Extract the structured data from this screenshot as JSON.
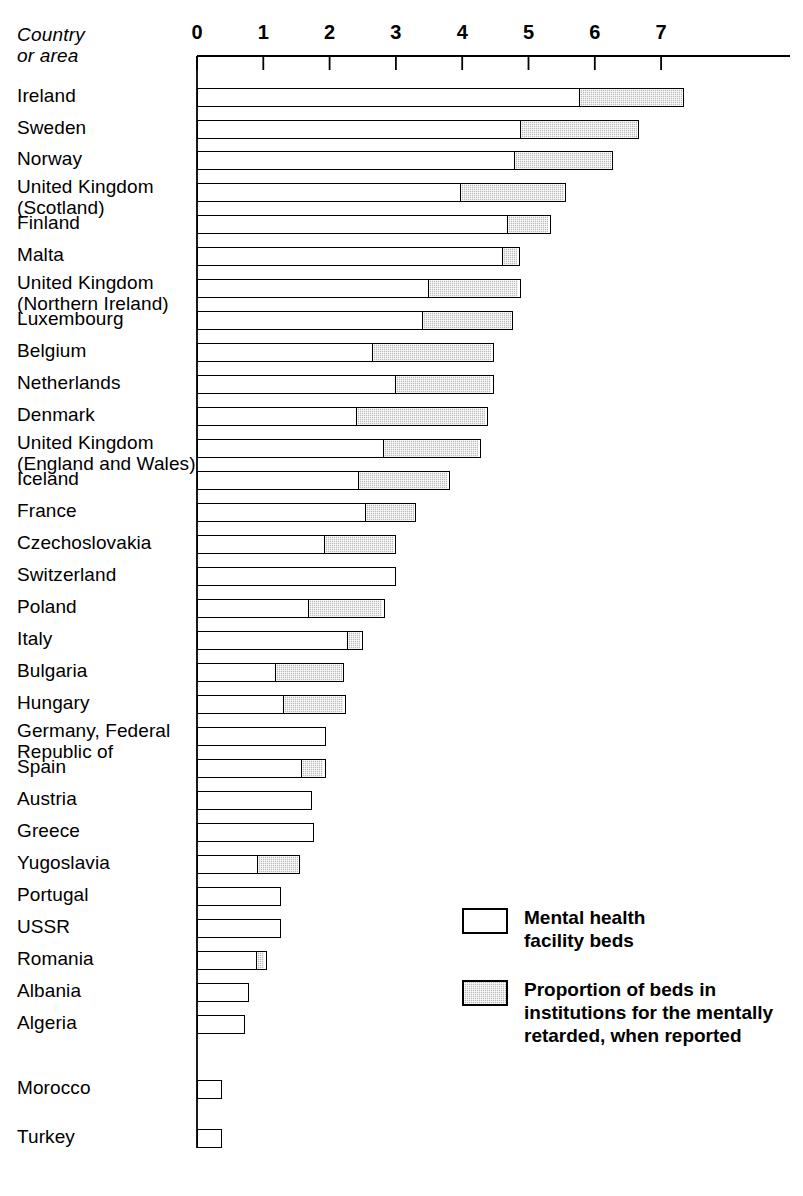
{
  "header": {
    "y_axis_title": "Country\nor area"
  },
  "legend": {
    "items": [
      {
        "swatch": "white",
        "label": "Mental health\nfacility beds"
      },
      {
        "swatch": "hatch",
        "label": "Proportion of beds in\ninstitutions for the mentally\nretarded, when reported"
      }
    ]
  },
  "chart_data": {
    "type": "bar",
    "orientation": "horizontal",
    "stacked": true,
    "title": "",
    "xlabel": "",
    "ylabel": "Country or area",
    "xlim": [
      0,
      7.6
    ],
    "grid": false,
    "legend_position": "inside-lower-right",
    "tick_labels": [
      "0",
      "1",
      "2",
      "3",
      "4",
      "5",
      "6",
      "7"
    ],
    "ticks": [
      0,
      1,
      2,
      3,
      4,
      5,
      6,
      7
    ],
    "series": [
      {
        "name": "Mental health facility beds",
        "fill": "white"
      },
      {
        "name": "Proportion of beds in institutions for the mentally retarded, when reported",
        "fill": "hatch"
      }
    ],
    "categories": [
      "Ireland",
      "Sweden",
      "Norway",
      "United Kingdom\n(Scotland)",
      "Finland",
      "Malta",
      "United Kingdom\n(Northern Ireland)",
      "Luxembourg",
      "Belgium",
      "Netherlands",
      "Denmark",
      "United Kingdom\n(England and Wales)",
      "Iceland",
      "France",
      "Czechoslovakia",
      "Switzerland",
      "Poland",
      "Italy",
      "Bulgaria",
      "Hungary",
      "Germany, Federal\n Republic of",
      "Spain",
      "Austria",
      "Greece",
      "Yugoslavia",
      "Portugal",
      "USSR",
      "Romania",
      "Albania",
      "Algeria",
      "Morocco",
      "Turkey"
    ],
    "rows": [
      {
        "label": "Ireland",
        "mental": 5.8,
        "retarded": 1.55,
        "total": 7.35,
        "label_lines": 1,
        "label_top": 85,
        "bar_top": 88
      },
      {
        "label": "Sweden",
        "mental": 4.91,
        "retarded": 1.76,
        "total": 6.67,
        "label_lines": 1,
        "label_top": 117,
        "bar_top": 120
      },
      {
        "label": "Norway",
        "mental": 4.82,
        "retarded": 1.46,
        "total": 6.28,
        "label_lines": 1,
        "label_top": 148,
        "bar_top": 151
      },
      {
        "label": "United Kingdom\n(Scotland)",
        "mental": 4.0,
        "retarded": 1.57,
        "total": 5.57,
        "label_lines": 2,
        "label_top": 176,
        "bar_top": 183
      },
      {
        "label": "Finland",
        "mental": 4.71,
        "retarded": 0.63,
        "total": 5.34,
        "label_lines": 1,
        "label_top": 212,
        "bar_top": 215
      },
      {
        "label": "Malta",
        "mental": 4.64,
        "retarded": 0.23,
        "total": 4.87,
        "label_lines": 1,
        "label_top": 244,
        "bar_top": 247
      },
      {
        "label": "United Kingdom\n(Northern Ireland)",
        "mental": 3.51,
        "retarded": 1.37,
        "total": 4.88,
        "label_lines": 2,
        "label_top": 272,
        "bar_top": 279
      },
      {
        "label": "Luxembourg",
        "mental": 3.42,
        "retarded": 1.35,
        "total": 4.77,
        "label_lines": 1,
        "label_top": 308,
        "bar_top": 311
      },
      {
        "label": "Belgium",
        "mental": 2.67,
        "retarded": 1.81,
        "total": 4.48,
        "label_lines": 1,
        "label_top": 340,
        "bar_top": 343
      },
      {
        "label": "Netherlands",
        "mental": 3.01,
        "retarded": 1.47,
        "total": 4.48,
        "label_lines": 1,
        "label_top": 372,
        "bar_top": 375
      },
      {
        "label": "Denmark",
        "mental": 2.43,
        "retarded": 1.96,
        "total": 4.39,
        "label_lines": 1,
        "label_top": 404,
        "bar_top": 407
      },
      {
        "label": "United Kingdom\n(England and Wales)",
        "mental": 2.83,
        "retarded": 1.45,
        "total": 4.28,
        "label_lines": 2,
        "label_top": 432,
        "bar_top": 439
      },
      {
        "label": "Iceland",
        "mental": 2.45,
        "retarded": 1.36,
        "total": 3.81,
        "label_lines": 1,
        "label_top": 468,
        "bar_top": 471
      },
      {
        "label": "France",
        "mental": 2.56,
        "retarded": 0.75,
        "total": 3.31,
        "label_lines": 1,
        "label_top": 500,
        "bar_top": 503
      },
      {
        "label": "Czechoslovakia",
        "mental": 1.95,
        "retarded": 1.05,
        "total": 3.0,
        "label_lines": 1,
        "label_top": 532,
        "bar_top": 535
      },
      {
        "label": "Switzerland",
        "mental": 3.0,
        "retarded": 0.0,
        "total": 3.0,
        "label_lines": 1,
        "label_top": 564,
        "bar_top": 567
      },
      {
        "label": "Poland",
        "mental": 1.7,
        "retarded": 1.13,
        "total": 2.83,
        "label_lines": 1,
        "label_top": 596,
        "bar_top": 599
      },
      {
        "label": "Italy",
        "mental": 2.3,
        "retarded": 0.2,
        "total": 2.5,
        "label_lines": 1,
        "label_top": 628,
        "bar_top": 631
      },
      {
        "label": "Bulgaria",
        "mental": 1.2,
        "retarded": 1.02,
        "total": 2.22,
        "label_lines": 1,
        "label_top": 660,
        "bar_top": 663
      },
      {
        "label": "Hungary",
        "mental": 1.32,
        "retarded": 0.92,
        "total": 2.24,
        "label_lines": 1,
        "label_top": 692,
        "bar_top": 695
      },
      {
        "label": "Germany, Federal\n Republic of",
        "mental": 1.94,
        "retarded": 0.0,
        "total": 1.94,
        "label_lines": 2,
        "label_top": 720,
        "bar_top": 727
      },
      {
        "label": "Spain",
        "mental": 1.61,
        "retarded": 0.33,
        "total": 1.94,
        "label_lines": 1,
        "label_top": 756,
        "bar_top": 759
      },
      {
        "label": "Austria",
        "mental": 1.74,
        "retarded": 0.0,
        "total": 1.74,
        "label_lines": 1,
        "label_top": 788,
        "bar_top": 791
      },
      {
        "label": "Greece",
        "mental": 1.76,
        "retarded": 0.0,
        "total": 1.76,
        "label_lines": 1,
        "label_top": 820,
        "bar_top": 823
      },
      {
        "label": "Yugoslavia",
        "mental": 0.93,
        "retarded": 0.63,
        "total": 1.56,
        "label_lines": 1,
        "label_top": 852,
        "bar_top": 855
      },
      {
        "label": "Portugal",
        "mental": 1.26,
        "retarded": 0.0,
        "total": 1.26,
        "label_lines": 1,
        "label_top": 884,
        "bar_top": 887
      },
      {
        "label": "USSR",
        "mental": 1.26,
        "retarded": 0.0,
        "total": 1.26,
        "label_lines": 1,
        "label_top": 916,
        "bar_top": 919
      },
      {
        "label": "Romania",
        "mental": 0.93,
        "retarded": 0.12,
        "total": 1.05,
        "label_lines": 1,
        "label_top": 948,
        "bar_top": 951
      },
      {
        "label": "Albania",
        "mental": 0.78,
        "retarded": 0.0,
        "total": 0.78,
        "label_lines": 1,
        "label_top": 980,
        "bar_top": 983
      },
      {
        "label": "Algeria",
        "mental": 0.72,
        "retarded": 0.0,
        "total": 0.72,
        "label_lines": 1,
        "label_top": 1012,
        "bar_top": 1015
      },
      {
        "label": "Morocco",
        "mental": 0.37,
        "retarded": 0.0,
        "total": 0.37,
        "label_lines": 1,
        "label_top": 1077,
        "bar_top": 1080
      },
      {
        "label": "Turkey",
        "mental": 0.38,
        "retarded": 0.0,
        "total": 0.38,
        "label_lines": 1,
        "label_top": 1126,
        "bar_top": 1129
      }
    ]
  },
  "geometry": {
    "x0_px": 197,
    "unit_px": 66.3,
    "bar_height_px": 19,
    "axis_line_y": 56,
    "axis_tick_bottom": 70,
    "plot_right_px": 790
  }
}
